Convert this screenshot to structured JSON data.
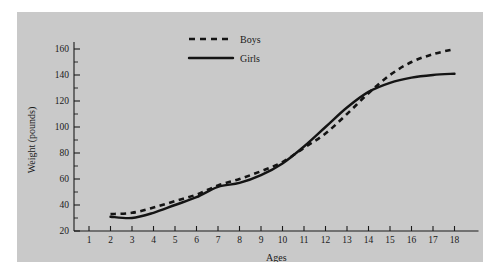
{
  "chart_data": {
    "type": "line",
    "title": "",
    "xlabel": "Ages",
    "ylabel": "Weight (pounds)",
    "xlim": [
      1,
      18
    ],
    "ylim": [
      20,
      160
    ],
    "y_ticks": [
      20,
      40,
      60,
      80,
      100,
      120,
      140,
      160
    ],
    "y_minor_step": 10,
    "x_ticks": [
      1,
      2,
      3,
      4,
      5,
      6,
      7,
      8,
      9,
      10,
      11,
      12,
      13,
      14,
      15,
      16,
      17,
      18
    ],
    "grid": false,
    "legend_position": "top-center",
    "x": [
      2,
      3,
      4,
      5,
      6,
      7,
      8,
      9,
      10,
      11,
      12,
      13,
      14,
      15,
      16,
      17,
      18
    ],
    "series": [
      {
        "name": "Boys",
        "style": "dashed",
        "color": "#141414",
        "values": [
          33,
          34,
          38,
          43,
          48,
          55,
          60,
          66,
          73,
          84,
          95,
          110,
          126,
          140,
          150,
          156,
          160
        ]
      },
      {
        "name": "Girls",
        "style": "solid",
        "color": "#141414",
        "values": [
          31,
          30,
          34,
          40,
          46,
          54,
          57,
          63,
          72,
          85,
          100,
          115,
          127,
          134,
          138,
          140,
          141
        ]
      }
    ]
  },
  "axis": {
    "y_title": "Weight (pounds)",
    "x_title": "Ages",
    "y_tick_labels": [
      "20",
      "40",
      "60",
      "80",
      "100",
      "120",
      "140",
      "160"
    ],
    "x_tick_labels": [
      "1",
      "2",
      "3",
      "4",
      "5",
      "6",
      "7",
      "8",
      "9",
      "10",
      "11",
      "12",
      "13",
      "14",
      "15",
      "16",
      "17",
      "18"
    ]
  },
  "legend": {
    "entries": [
      {
        "label": "Boys",
        "style": "dashed"
      },
      {
        "label": "Girls",
        "style": "solid"
      }
    ]
  },
  "colors": {
    "panel_background": "#c9c9c9",
    "page_background": "#ffffff",
    "ink": "#141414"
  }
}
